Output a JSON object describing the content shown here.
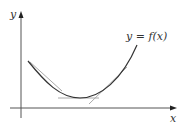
{
  "diagram": {
    "type": "function-graph-with-tangents",
    "axes": {
      "x_label": "x",
      "y_label": "y"
    },
    "curve": {
      "label": "y = f(x)",
      "shape": "convex (concave up)",
      "start": [
        28,
        61
      ],
      "minimum": [
        80,
        98
      ],
      "end": [
        137,
        45
      ]
    },
    "tangent_lines": [
      {
        "name": "tangent-left",
        "from": [
          30,
          62
        ],
        "to": [
          62,
          91
        ]
      },
      {
        "name": "tangent-bottom",
        "from": [
          58,
          98
        ],
        "to": [
          99,
          98
        ]
      },
      {
        "name": "tangent-right",
        "from": [
          89,
          104
        ],
        "to": [
          127,
          67
        ]
      }
    ],
    "colors": {
      "axes": "#555555",
      "curve": "#333333",
      "tangents": "#aaaaaa",
      "text": "#333333",
      "background": "#ffffff"
    }
  }
}
